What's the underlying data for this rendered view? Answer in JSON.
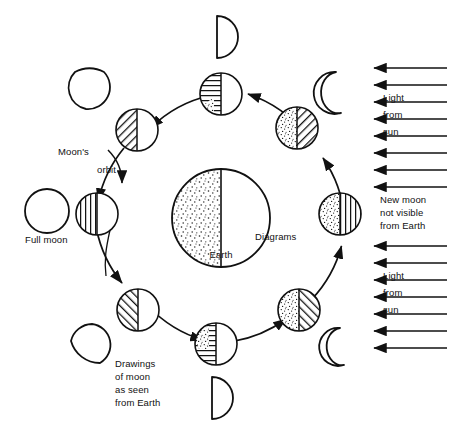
{
  "figure": {
    "background_color": "#ffffff",
    "ink_color": "#111111"
  },
  "labels": {
    "earth": "Earth",
    "moons_orbit_line1": "Moon's",
    "moons_orbit_line2": "orbit",
    "full_moon": "Full moon",
    "diagrams": "Diagrams",
    "drawings_line1": "Drawings",
    "drawings_line2": "of moon",
    "drawings_line3": "as seen",
    "drawings_line4": "from Earth",
    "new_moon_line1": "New moon",
    "new_moon_line2": "not visible",
    "new_moon_line3": "from Earth",
    "light_top_line1": "Light",
    "light_top_line2": "from",
    "light_top_line3": "sun",
    "light_bottom_line1": "Light",
    "light_bottom_line2": "from",
    "light_bottom_line3": "sun"
  },
  "sun_rays": {
    "direction": "right-to-left",
    "count": 15,
    "x_start": 447,
    "x_end": 372,
    "y_values": [
      68,
      85,
      102,
      119,
      136,
      153,
      170,
      187,
      246,
      263,
      280,
      297,
      314,
      331,
      348
    ]
  },
  "orbit": {
    "center_x": 221,
    "center_y": 218,
    "radius": 124,
    "label": "Moon's orbit"
  },
  "earth": {
    "center_x": 221,
    "center_y": 218,
    "radius": 49,
    "shaded_side": "left",
    "lit_side": "right"
  },
  "moon_positions": [
    {
      "name": "first-quarter-diagram",
      "angle_deg": 270,
      "cx": 221,
      "cy": 94,
      "r": 21,
      "left_fill": "horizontal-hatch",
      "right_fill": "white",
      "drawing": {
        "shape": "half-right-lit",
        "cx": 221,
        "cy": 37,
        "r": 21
      }
    },
    {
      "name": "waxing-crescent-diagram",
      "angle_deg": 315,
      "cx": 297,
      "cy": 128,
      "r": 21,
      "left_fill": "stipple",
      "right_fill": "diagonal-hatch-forward",
      "drawing": {
        "shape": "crescent-right-lit",
        "cx": 346,
        "cy": 92,
        "r": 21
      }
    },
    {
      "name": "new-moon-diagram",
      "angle_deg": 0,
      "cx": 340,
      "cy": 214,
      "r": 21,
      "left_fill": "stipple",
      "right_fill": "vertical-hatch",
      "drawing": {
        "shape": "none",
        "cx": 0,
        "cy": 0,
        "r": 0
      }
    },
    {
      "name": "waning-crescent-diagram",
      "angle_deg": 45,
      "cx": 299,
      "cy": 310,
      "r": 21,
      "left_fill": "stipple",
      "right_fill": "diagonal-hatch-back",
      "drawing": {
        "shape": "crescent-left-lit",
        "cx": 348,
        "cy": 345,
        "r": 21
      }
    },
    {
      "name": "last-quarter-diagram",
      "angle_deg": 90,
      "cx": 216,
      "cy": 344,
      "r": 21,
      "left_fill": "horizontal-hatch",
      "right_fill": "white",
      "drawing": {
        "shape": "half-right-lit",
        "cx": 216,
        "cy": 398,
        "r": 21
      }
    },
    {
      "name": "waning-gibbous-diagram",
      "angle_deg": 135,
      "cx": 138,
      "cy": 310,
      "r": 21,
      "left_fill": "diagonal-hatch-back",
      "right_fill": "white",
      "drawing": {
        "shape": "gibbous-bottom",
        "cx": 90,
        "cy": 345,
        "r": 21
      }
    },
    {
      "name": "full-moon-diagram",
      "angle_deg": 180,
      "cx": 97,
      "cy": 214,
      "r": 21,
      "left_fill": "vertical-hatch",
      "right_fill": "white",
      "drawing": {
        "shape": "full",
        "cx": 47,
        "cy": 211,
        "r": 22
      }
    },
    {
      "name": "waxing-gibbous-diagram",
      "angle_deg": 225,
      "cx": 137,
      "cy": 130,
      "r": 21,
      "left_fill": "diagonal-hatch-forward",
      "right_fill": "white",
      "drawing": {
        "shape": "gibbous-top",
        "cx": 90,
        "cy": 87,
        "r": 21
      }
    }
  ],
  "orbit_arrows": {
    "direction": "counterclockwise-from-top",
    "count": 8
  }
}
